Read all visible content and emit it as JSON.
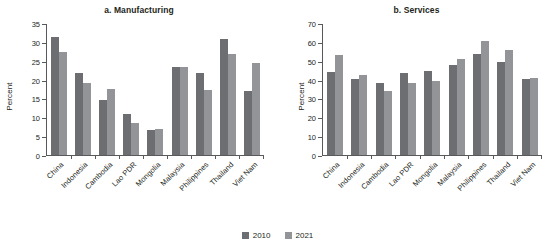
{
  "legend": {
    "items": [
      {
        "label": "2010",
        "color": "#6d6e71"
      },
      {
        "label": "2021",
        "color": "#929497"
      }
    ]
  },
  "chart_data": [
    {
      "type": "bar",
      "title": "a. Manufacturing",
      "xlabel": "",
      "ylabel": "Percent",
      "ylim": [
        0,
        35
      ],
      "yticks": [
        0,
        5,
        10,
        15,
        20,
        25,
        30,
        35
      ],
      "grid": false,
      "legend_position": "bottom-center",
      "categories": [
        "China",
        "Indonesia",
        "Cambodia",
        "Lao PDR",
        "Mongolia",
        "Malaysia",
        "Philippines",
        "Thailand",
        "Viet Nam"
      ],
      "series": [
        {
          "name": "2010",
          "color": "#6d6e71",
          "values": [
            31.6,
            22.0,
            14.6,
            11.0,
            6.8,
            23.4,
            22.0,
            30.9,
            17.1
          ]
        },
        {
          "name": "2021",
          "color": "#929497",
          "values": [
            27.4,
            19.2,
            17.7,
            8.5,
            7.0,
            23.4,
            17.5,
            27.1,
            24.5
          ]
        }
      ]
    },
    {
      "type": "bar",
      "title": "b. Services",
      "xlabel": "",
      "ylabel": "Percent",
      "ylim": [
        0,
        70
      ],
      "yticks": [
        0,
        10,
        20,
        30,
        40,
        50,
        60,
        70
      ],
      "grid": false,
      "legend_position": "bottom-center",
      "categories": [
        "China",
        "Indonesia",
        "Cambodia",
        "Lao PDR",
        "Mongolia",
        "Malaysia",
        "Philippines",
        "Thailand",
        "Viet Nam"
      ],
      "series": [
        {
          "name": "2010",
          "color": "#6d6e71",
          "values": [
            44.2,
            40.7,
            38.3,
            43.6,
            44.9,
            48.3,
            53.9,
            49.7,
            40.5
          ]
        },
        {
          "name": "2021",
          "color": "#929497",
          "values": [
            53.2,
            42.6,
            34.1,
            38.6,
            39.4,
            51.2,
            60.8,
            56.1,
            41.0
          ]
        }
      ]
    }
  ]
}
